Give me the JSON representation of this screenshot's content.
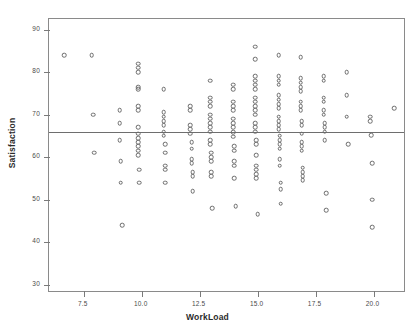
{
  "chart_data": {
    "type": "scatter",
    "title": "",
    "xlabel": "WorkLoad",
    "ylabel": "Satisfaction",
    "xlim": [
      6.0,
      21.4
    ],
    "ylim": [
      28.0,
      92.5
    ],
    "grid": false,
    "legend": null,
    "xticks": [
      "7.5",
      "10.0",
      "12.5",
      "15.0",
      "17.5",
      "20.0"
    ],
    "xtick_values": [
      7.5,
      10.0,
      12.5,
      15.0,
      17.5,
      20.0
    ],
    "yticks": [
      "30",
      "40",
      "50",
      "60",
      "70",
      "80",
      "90"
    ],
    "ytick_values": [
      30,
      40,
      50,
      60,
      70,
      80,
      90
    ],
    "reference_line": {
      "orientation": "horizontal",
      "y": 65.9,
      "label": ""
    },
    "marker": {
      "shape": "open-circle",
      "color": "#6b6b6b",
      "size": 4.6
    },
    "points": [
      [
        6.65,
        84.0
      ],
      [
        7.85,
        84.0
      ],
      [
        7.9,
        70.0
      ],
      [
        7.95,
        61.0
      ],
      [
        9.05,
        71.0
      ],
      [
        9.05,
        68.0
      ],
      [
        9.05,
        64.0
      ],
      [
        9.1,
        59.0
      ],
      [
        9.1,
        54.0
      ],
      [
        9.15,
        44.0
      ],
      [
        9.85,
        82.0
      ],
      [
        9.85,
        81.0
      ],
      [
        9.85,
        80.0
      ],
      [
        9.85,
        76.5
      ],
      [
        9.85,
        76.0
      ],
      [
        9.85,
        72.0
      ],
      [
        9.85,
        71.0
      ],
      [
        9.85,
        67.0
      ],
      [
        9.85,
        65.5
      ],
      [
        9.85,
        64.5
      ],
      [
        9.85,
        63.5
      ],
      [
        9.85,
        62.5
      ],
      [
        9.85,
        61.5
      ],
      [
        9.85,
        60.5
      ],
      [
        9.9,
        57.0
      ],
      [
        9.9,
        54.0
      ],
      [
        10.95,
        76.0
      ],
      [
        10.95,
        70.5
      ],
      [
        10.95,
        69.5
      ],
      [
        10.95,
        68.5
      ],
      [
        10.95,
        67.5
      ],
      [
        10.95,
        66.0
      ],
      [
        10.95,
        65.0
      ],
      [
        11.0,
        63.0
      ],
      [
        11.0,
        61.0
      ],
      [
        11.0,
        58.0
      ],
      [
        11.0,
        57.0
      ],
      [
        11.0,
        54.0
      ],
      [
        12.1,
        72.0
      ],
      [
        12.1,
        71.0
      ],
      [
        12.1,
        67.5
      ],
      [
        12.1,
        66.5
      ],
      [
        12.1,
        65.5
      ],
      [
        12.15,
        63.5
      ],
      [
        12.15,
        62.0
      ],
      [
        12.15,
        59.5
      ],
      [
        12.15,
        58.5
      ],
      [
        12.2,
        56.5
      ],
      [
        12.2,
        55.5
      ],
      [
        12.2,
        52.0
      ],
      [
        12.95,
        78.0
      ],
      [
        12.95,
        74.0
      ],
      [
        12.95,
        73.0
      ],
      [
        12.95,
        72.0
      ],
      [
        12.95,
        70.0
      ],
      [
        12.95,
        69.0
      ],
      [
        12.95,
        68.0
      ],
      [
        12.95,
        67.0
      ],
      [
        12.95,
        66.0
      ],
      [
        12.95,
        64.0
      ],
      [
        12.95,
        63.0
      ],
      [
        13.0,
        61.0
      ],
      [
        13.0,
        60.0
      ],
      [
        13.0,
        59.0
      ],
      [
        13.0,
        56.5
      ],
      [
        13.0,
        55.5
      ],
      [
        13.05,
        48.0
      ],
      [
        13.95,
        77.0
      ],
      [
        13.95,
        76.0
      ],
      [
        13.95,
        73.0
      ],
      [
        13.95,
        72.0
      ],
      [
        13.95,
        71.0
      ],
      [
        13.95,
        69.0
      ],
      [
        13.95,
        68.0
      ],
      [
        13.95,
        67.0
      ],
      [
        13.95,
        65.8
      ],
      [
        13.95,
        64.8
      ],
      [
        14.0,
        62.5
      ],
      [
        14.0,
        61.5
      ],
      [
        14.0,
        59.0
      ],
      [
        14.0,
        58.0
      ],
      [
        14.0,
        55.0
      ],
      [
        14.05,
        48.5
      ],
      [
        14.9,
        86.0
      ],
      [
        14.9,
        83.0
      ],
      [
        14.9,
        79.0
      ],
      [
        14.9,
        78.0
      ],
      [
        14.9,
        77.0
      ],
      [
        14.9,
        76.0
      ],
      [
        14.9,
        74.0
      ],
      [
        14.9,
        73.0
      ],
      [
        14.9,
        72.0
      ],
      [
        14.9,
        71.0
      ],
      [
        14.9,
        70.0
      ],
      [
        14.9,
        68.0
      ],
      [
        14.9,
        67.0
      ],
      [
        14.9,
        66.0
      ],
      [
        14.95,
        64.0
      ],
      [
        14.95,
        63.0
      ],
      [
        14.95,
        60.5
      ],
      [
        14.95,
        58.0
      ],
      [
        14.95,
        57.0
      ],
      [
        14.95,
        56.0
      ],
      [
        14.95,
        55.0
      ],
      [
        15.0,
        46.5
      ],
      [
        15.9,
        84.0
      ],
      [
        15.9,
        79.0
      ],
      [
        15.9,
        78.0
      ],
      [
        15.9,
        77.0
      ],
      [
        15.9,
        74.5
      ],
      [
        15.9,
        73.5
      ],
      [
        15.9,
        72.5
      ],
      [
        15.9,
        71.5
      ],
      [
        15.9,
        69.5
      ],
      [
        15.9,
        68.5
      ],
      [
        15.9,
        67.5
      ],
      [
        15.9,
        66.5
      ],
      [
        15.95,
        65.0
      ],
      [
        15.95,
        64.0
      ],
      [
        15.95,
        63.0
      ],
      [
        15.95,
        62.0
      ],
      [
        15.95,
        59.5
      ],
      [
        15.95,
        58.0
      ],
      [
        16.0,
        54.0
      ],
      [
        16.0,
        52.5
      ],
      [
        16.0,
        49.0
      ],
      [
        16.85,
        83.5
      ],
      [
        16.85,
        78.5
      ],
      [
        16.85,
        77.5
      ],
      [
        16.85,
        76.5
      ],
      [
        16.85,
        75.5
      ],
      [
        16.85,
        73.0
      ],
      [
        16.85,
        72.0
      ],
      [
        16.85,
        71.0
      ],
      [
        16.9,
        68.5
      ],
      [
        16.9,
        67.5
      ],
      [
        16.9,
        65.5
      ],
      [
        16.9,
        63.5
      ],
      [
        16.9,
        62.5
      ],
      [
        16.9,
        61.5
      ],
      [
        16.95,
        57.5
      ],
      [
        16.95,
        56.5
      ],
      [
        16.95,
        55.5
      ],
      [
        16.95,
        54.5
      ],
      [
        17.85,
        79.0
      ],
      [
        17.85,
        78.0
      ],
      [
        17.85,
        74.0
      ],
      [
        17.85,
        73.0
      ],
      [
        17.85,
        71.0
      ],
      [
        17.85,
        70.0
      ],
      [
        17.9,
        68.0
      ],
      [
        17.9,
        67.0
      ],
      [
        17.9,
        66.0
      ],
      [
        17.9,
        64.0
      ],
      [
        17.95,
        51.5
      ],
      [
        17.95,
        47.5
      ],
      [
        18.85,
        80.0
      ],
      [
        18.85,
        74.5
      ],
      [
        18.85,
        69.5
      ],
      [
        18.9,
        63.0
      ],
      [
        19.85,
        69.5
      ],
      [
        19.85,
        68.5
      ],
      [
        19.9,
        65.2
      ],
      [
        19.95,
        58.5
      ],
      [
        19.95,
        50.0
      ],
      [
        19.95,
        43.5
      ],
      [
        20.9,
        71.5
      ]
    ]
  }
}
